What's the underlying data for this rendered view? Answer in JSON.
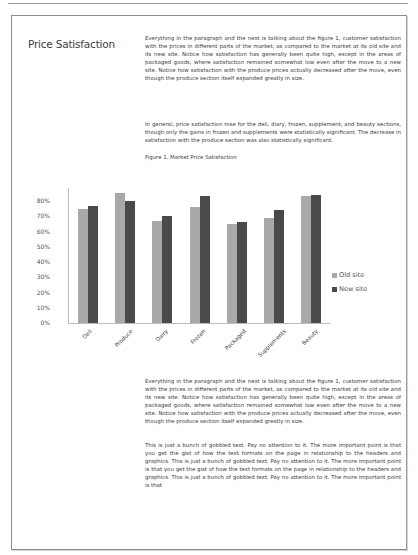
{
  "document": {
    "heading": "Price Satisfaction",
    "paragraph1": "Everything in the paragraph and the next is talking about the figure 1, customer satisfaction with the prices in different parts of the market, as compared to the market at its old site and its new site. Notice how satisfaction has generally been quite high, except in the areas of packaged goods, where satisfaction remained somewhat low even after the move to a new site. Notice how satisfaction with the produce prices actually decreased after the move, even though the produce section itself expanded greatly in size.",
    "paragraph2": "In general, price satisfaction rose for the deli, diary, frozen, supplement, and beauty sections, though only the gains in frozen and supplements were statistically significant. The decrease in satisfaction with the produce section was also statistically significant.",
    "figure_caption": "Figure 1. Market Price Satisfaction",
    "paragraph3": "Everything in the paragraph and the next is talking about the figure 1, customer satisfaction with the prices in different parts of the market, as compared to the market at its old site and its new site. Notice how satisfaction has generally been quite high, except in the areas of packaged goods, where satisfaction remained somewhat low even after the move to a new site. Notice how satisfaction with the produce prices actually decreased after the move, even though the produce section itself expanded greatly in size.",
    "paragraph4": "This is just a bunch of gobbled text. Pay no attention to it. The more important point is that you get the gist of how the text formats on the page in relationship to the headers and graphics. This is just a bunch of gobbled text. Pay no attention to it. The more important point is that you get the gist of how the text formats on the page in relationship to the headers and graphics. This is just a bunch of gobbled text. Pay no attention to it. The more important point is that"
  },
  "chart_data": {
    "type": "bar",
    "title": "Figure 1. Market Price Satisfaction",
    "categories": [
      "Deli",
      "Produce",
      "Dairy",
      "Frozen",
      "Packaged",
      "Supplements",
      "Beauty"
    ],
    "series": [
      {
        "name": "Old site",
        "color": "#a9a9a9",
        "values": [
          75,
          85,
          67,
          76,
          65,
          69,
          83
        ]
      },
      {
        "name": "New site",
        "color": "#4a4a4a",
        "values": [
          77,
          80,
          70,
          83,
          66,
          74,
          84
        ]
      }
    ],
    "xlabel": "",
    "ylabel": "",
    "ylim": [
      0,
      80
    ],
    "yticks": [
      "0%",
      "10%",
      "20%",
      "30%",
      "40%",
      "50%",
      "60%",
      "70%",
      "80%"
    ],
    "grid": false,
    "legend_position": "right"
  }
}
